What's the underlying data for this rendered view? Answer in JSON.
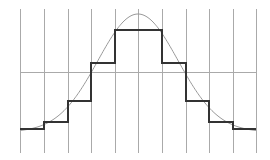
{
  "chart_data": {
    "type": "line",
    "title": "",
    "xlabel": "",
    "ylabel": "",
    "description": "Gaussian bell curve approximated by a piecewise-constant step function over 10 equal bins",
    "grid": {
      "vertical_lines_x": [
        20,
        44,
        68,
        91,
        115,
        138,
        162,
        186,
        209,
        233,
        256
      ],
      "vertical_y_range": [
        9,
        153
      ],
      "horizontal_line_y": 72,
      "horizontal_x_range": [
        20,
        256
      ],
      "color": "#aaaaaa"
    },
    "bins": [
      1,
      2,
      3,
      4,
      5,
      6,
      7,
      8,
      9,
      10
    ],
    "step_values": [
      0.05,
      0.12,
      0.3,
      0.55,
      0.85,
      0.85,
      0.55,
      0.3,
      0.12,
      0.05
    ],
    "step_pixel_y": [
      129,
      122,
      101,
      63,
      30,
      30,
      63,
      101,
      122,
      129
    ],
    "curve": {
      "type": "gaussian",
      "peak_value": 1.0,
      "peak_pixel": [
        138,
        14
      ],
      "baseline_pixel_y": 132,
      "sigma_px": 40,
      "color": "#999999"
    },
    "series": [
      {
        "name": "gaussian-curve",
        "color": "#999999",
        "stroke_width": 1
      },
      {
        "name": "step-approximation",
        "color": "#333333",
        "stroke_width": 2
      }
    ]
  }
}
